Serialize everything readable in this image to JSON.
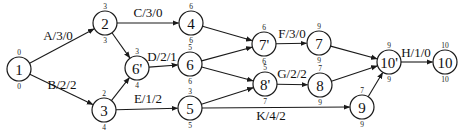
{
  "diagram": {
    "type": "activity-on-arrow network",
    "nodes": [
      {
        "id": "1",
        "label": "1",
        "x": 19,
        "y": 69,
        "top": "0",
        "bottom": "0"
      },
      {
        "id": "2",
        "label": "2",
        "x": 105,
        "y": 23,
        "top": "3",
        "bottom": "3"
      },
      {
        "id": "6p",
        "label": "6'",
        "x": 137,
        "y": 68,
        "top": "3",
        "bottom": "4"
      },
      {
        "id": "3",
        "label": "3",
        "x": 104,
        "y": 110,
        "top": "2",
        "bottom": "4"
      },
      {
        "id": "4",
        "label": "4",
        "x": 191,
        "y": 23,
        "top": "6",
        "bottom": "6"
      },
      {
        "id": "6",
        "label": "6",
        "x": 190,
        "y": 64,
        "top": "5",
        "bottom": "6"
      },
      {
        "id": "5",
        "label": "5",
        "x": 190,
        "y": 108,
        "top": "3",
        "bottom": "5"
      },
      {
        "id": "7p",
        "label": "7'",
        "x": 264,
        "y": 44,
        "top": "6",
        "bottom": "6"
      },
      {
        "id": "8p",
        "label": "8'",
        "x": 265,
        "y": 84,
        "top": "5",
        "bottom": "7"
      },
      {
        "id": "7",
        "label": "7",
        "x": 319,
        "y": 43,
        "top": "9",
        "bottom": "9"
      },
      {
        "id": "8",
        "label": "8",
        "x": 320,
        "y": 85,
        "top": "7",
        "bottom": "9"
      },
      {
        "id": "9",
        "label": "9",
        "x": 362,
        "y": 107,
        "top": "7",
        "bottom": "9"
      },
      {
        "id": "10p",
        "label": "10'",
        "x": 389,
        "y": 62,
        "top": "9",
        "bottom": "9"
      },
      {
        "id": "10",
        "label": "10",
        "x": 445,
        "y": 62,
        "top": "10",
        "bottom": "10"
      }
    ],
    "edges": [
      {
        "from": "1",
        "to": "2",
        "label": "A/3/0",
        "lx": 58,
        "ly": 40,
        "arrow": true
      },
      {
        "from": "1",
        "to": "3",
        "label": "B/2/2",
        "lx": 62,
        "ly": 89,
        "arrow": true
      },
      {
        "from": "2",
        "to": "4",
        "label": "C/3/0",
        "lx": 148,
        "ly": 17,
        "arrow": true
      },
      {
        "from": "2",
        "to": "6p",
        "label": "",
        "arrow": true
      },
      {
        "from": "3",
        "to": "6p",
        "label": "",
        "arrow": true
      },
      {
        "from": "6p",
        "to": "6",
        "label": "D/2/1",
        "lx": 162,
        "ly": 61,
        "arrow": true
      },
      {
        "from": "3",
        "to": "5",
        "label": "E/1/2",
        "lx": 148,
        "ly": 103,
        "arrow": true
      },
      {
        "from": "4",
        "to": "7p",
        "label": "",
        "arrow": true
      },
      {
        "from": "6",
        "to": "7p",
        "label": "",
        "arrow": true
      },
      {
        "from": "6",
        "to": "8p",
        "label": "",
        "arrow": true
      },
      {
        "from": "5",
        "to": "8p",
        "label": "",
        "arrow": true
      },
      {
        "from": "7p",
        "to": "7",
        "label": "F/3/0",
        "lx": 292,
        "ly": 38,
        "arrow": true
      },
      {
        "from": "8p",
        "to": "8",
        "label": "G/2/2",
        "lx": 292,
        "ly": 78,
        "arrow": true
      },
      {
        "from": "5",
        "to": "9",
        "label": "K/4/2",
        "lx": 271,
        "ly": 120,
        "arrow": true
      },
      {
        "from": "7",
        "to": "10p",
        "label": "",
        "arrow": true
      },
      {
        "from": "8",
        "to": "10p",
        "label": "",
        "arrow": true
      },
      {
        "from": "9",
        "to": "10p",
        "label": "",
        "arrow": true
      },
      {
        "from": "10p",
        "to": "10",
        "label": "H/1/0",
        "lx": 416,
        "ly": 57,
        "arrow": true
      }
    ],
    "node_radius": 12,
    "colors": {
      "stroke": "#1a1a1a",
      "background": "#ffffff",
      "text": "#111111"
    }
  }
}
